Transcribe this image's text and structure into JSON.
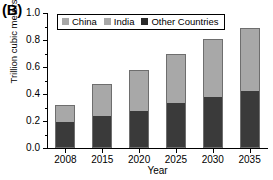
{
  "panel": {
    "label": "(B)"
  },
  "chart_data": {
    "type": "bar",
    "stacked": true,
    "title": "",
    "xlabel": "Year",
    "ylabel": "Trillion cubic meters",
    "categories": [
      "2008",
      "2015",
      "2020",
      "2025",
      "2030",
      "2035"
    ],
    "series": [
      {
        "name": "Other Countries",
        "color": "#3a3a3a",
        "values": [
          0.195,
          0.235,
          0.275,
          0.33,
          0.38,
          0.42
        ]
      },
      {
        "name": "India",
        "color": "#a8a8a8",
        "values": [
          0.06,
          0.12,
          0.15,
          0.185,
          0.215,
          0.235
        ]
      },
      {
        "name": "China",
        "color": "#a8a8a8",
        "values": [
          0.065,
          0.12,
          0.155,
          0.185,
          0.215,
          0.235
        ]
      }
    ],
    "totals": [
      0.32,
      0.475,
      0.58,
      0.7,
      0.81,
      0.89
    ],
    "ylim": [
      0.0,
      1.0
    ],
    "yticks": [
      "0.0",
      "0.2",
      "0.4",
      "0.6",
      "0.8",
      "1.0"
    ],
    "ytick_values": [
      0.0,
      0.2,
      0.4,
      0.6,
      0.8,
      1.0
    ],
    "grid": false,
    "legend_position": "top-left-inside"
  },
  "legend": {
    "items": [
      {
        "label": "China",
        "color": "#a8a8a8"
      },
      {
        "label": "India",
        "color": "#a8a8a8"
      },
      {
        "label": "Other Countries",
        "color": "#2a2a2a"
      }
    ]
  }
}
